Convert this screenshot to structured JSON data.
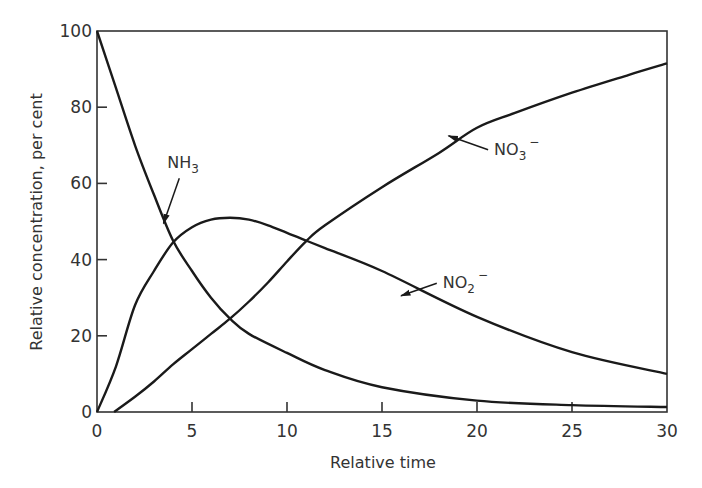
{
  "chart_data": {
    "type": "line",
    "title": "",
    "xlabel": "Relative time",
    "ylabel": "Relative concentration, per cent",
    "xlim": [
      0,
      30
    ],
    "ylim": [
      0,
      100
    ],
    "xticks": [
      0,
      5,
      10,
      15,
      20,
      25,
      30
    ],
    "yticks": [
      0,
      20,
      40,
      60,
      80,
      100
    ],
    "grid": false,
    "legend": "inline arrow annotations",
    "series": [
      {
        "name": "NH3",
        "label_main": "NH",
        "label_sub": "3",
        "label_sup": "",
        "x": [
          0,
          1,
          2,
          3,
          4,
          5,
          6,
          7,
          8,
          10,
          12,
          15,
          20,
          25,
          30
        ],
        "values": [
          100,
          85,
          70,
          57,
          45,
          37,
          30,
          24.5,
          20.5,
          15.5,
          11,
          6.5,
          3,
          1.8,
          1.3
        ]
      },
      {
        "name": "NO2-",
        "label_main": "NO",
        "label_sub": "2",
        "label_sup": "−",
        "x": [
          0,
          1,
          2,
          3,
          4,
          5,
          6,
          7,
          8,
          9,
          10,
          11,
          12,
          15,
          20,
          25,
          30
        ],
        "values": [
          0,
          12,
          28,
          37,
          44.5,
          48.5,
          50.5,
          51,
          50.5,
          49,
          47,
          45,
          43,
          37,
          25,
          15.7,
          10
        ]
      },
      {
        "name": "NO3-",
        "label_main": "NO",
        "label_sub": "3",
        "label_sup": "−",
        "x": [
          0.9,
          2,
          3,
          4,
          5,
          6,
          7,
          8,
          9,
          10,
          11,
          12,
          15,
          18,
          20,
          22,
          25,
          28,
          30
        ],
        "values": [
          0,
          4,
          8,
          12.5,
          16.5,
          20.5,
          24.5,
          29,
          34,
          39.5,
          44.8,
          49,
          59,
          68,
          74.6,
          78.5,
          83.8,
          88.5,
          91.5
        ]
      }
    ],
    "annotations": [
      {
        "series": "NH3",
        "text_x": 3.7,
        "text_y": 64,
        "arrow_to_x": 3.5,
        "arrow_to_y": 49.5
      },
      {
        "series": "NO3-",
        "text_x": 20.9,
        "text_y": 67.5,
        "arrow_to_x": 18.5,
        "arrow_to_y": 72.5
      },
      {
        "series": "NO2-",
        "text_x": 18.2,
        "text_y": 32.5,
        "arrow_to_x": 16.0,
        "arrow_to_y": 30.5
      }
    ]
  }
}
